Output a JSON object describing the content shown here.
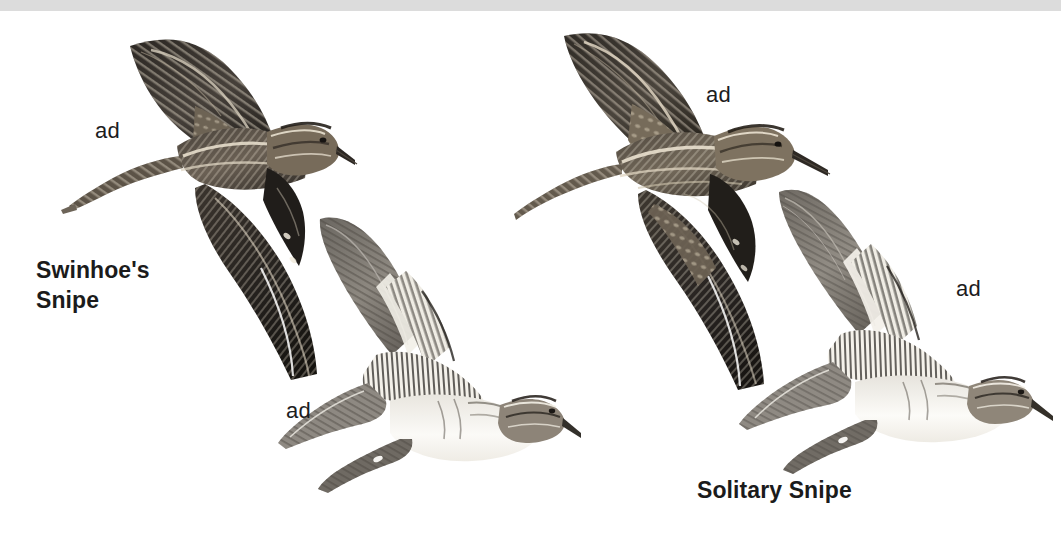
{
  "plate": {
    "width": 1061,
    "height": 536,
    "background_color": "#ffffff",
    "top_band_color": "#dcdcdc",
    "text_color": "#1b1b1b"
  },
  "species": [
    {
      "id": "swinhoes-snipe",
      "label": "Swinhoe's\nSnipe",
      "label_line1": "Swinhoe's",
      "label_line2": "Snipe"
    },
    {
      "id": "solitary-snipe",
      "label": "Solitary Snipe"
    }
  ],
  "age_labels": {
    "swinhoe_upper": "ad",
    "swinhoe_under": "ad",
    "solitary_upper": "ad",
    "solitary_under": "ad"
  },
  "figures": [
    {
      "id": "swinhoe-upperside",
      "species": "Swinhoe's Snipe",
      "age": "ad",
      "view": "upperside-in-flight",
      "tone": "dark"
    },
    {
      "id": "swinhoe-underside",
      "species": "Swinhoe's Snipe",
      "age": "ad",
      "view": "underside-in-flight",
      "tone": "pale"
    },
    {
      "id": "solitary-upperside",
      "species": "Solitary Snipe",
      "age": "ad",
      "view": "upperside-in-flight",
      "tone": "dark"
    },
    {
      "id": "solitary-underside",
      "species": "Solitary Snipe",
      "age": "ad",
      "view": "underside-in-flight",
      "tone": "pale"
    }
  ]
}
